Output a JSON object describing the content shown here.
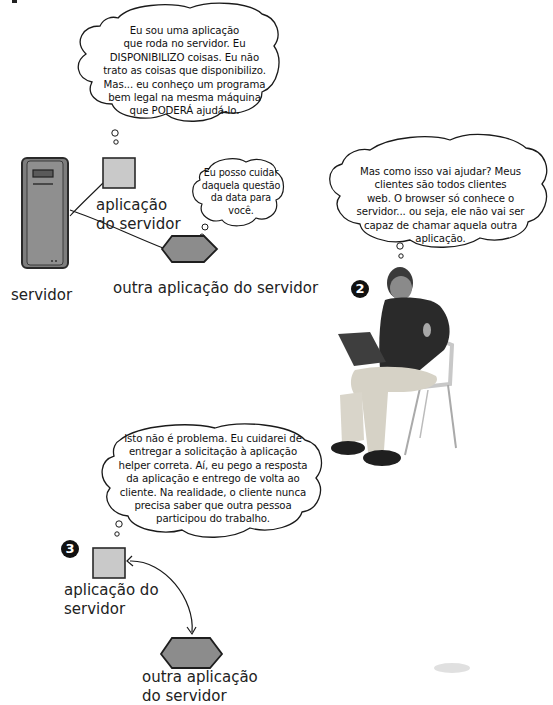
{
  "page_marker": "r",
  "scene1": {
    "server_label": "servidor",
    "app_label_line1": "aplicação",
    "app_label_line2": "do servidor",
    "other_app_label": "outra aplicação do servidor",
    "bubble_app": [
      "Eu sou uma aplicação",
      "que roda no servidor. Eu",
      "DISPONIBILIZO coisas. Eu não",
      "trato as coisas que disponibilizo.",
      "Mas... eu conheço um programa",
      "bem legal na mesma máquina",
      "que PODERÁ ajudá-lo."
    ],
    "bubble_other_app": [
      "Eu posso cuidar",
      "daquela questão",
      "da data para",
      "você."
    ]
  },
  "scene2": {
    "badge": "2",
    "bubble_developer": [
      "Mas como isso vai ajudar? Meus",
      "clientes são todos clientes",
      "web. O browser só conhece o",
      "servidor... ou seja, ele não vai ser",
      "capaz de chamar aquela outra",
      "aplicação."
    ],
    "figure": "man-with-laptop-sitting-on-chair"
  },
  "scene3": {
    "badge": "3",
    "bubble_app": [
      "Isto não é problema. Eu cuidarei de",
      "entregar a solicitação à aplicação",
      "helper correta. Aí, eu pego a resposta",
      "da aplicação e entrego de volta ao",
      "cliente. Na realidade, o cliente nunca",
      "precisa saber que outra pessoa",
      "participou do trabalho."
    ],
    "app_label_line1": "aplicação do",
    "app_label_line2": "servidor",
    "other_app_label_line1": "outra aplicação",
    "other_app_label_line2": "do servidor"
  },
  "colors": {
    "box_fill": "#c9c9c9",
    "hex_fill": "#8c8c8c",
    "server_fill": "#8a8a8a",
    "ink": "#1a1a1a",
    "badge": "#111111"
  }
}
